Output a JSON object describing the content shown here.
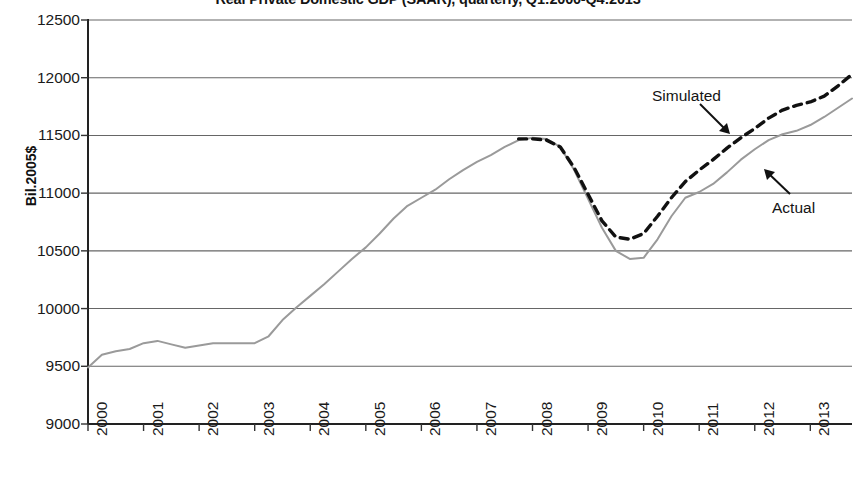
{
  "chart_data": {
    "type": "line",
    "title": "Real Private Domestic GDP (SAAR), quarterly, Q1:2000-Q4:2013",
    "xlabel": "",
    "ylabel": "Bil.2005$",
    "ylim": [
      9000,
      12500
    ],
    "ytick_step": 500,
    "yticks": [
      "12500",
      "12000",
      "11500",
      "11000",
      "10500",
      "10000",
      "9500",
      "9000"
    ],
    "xlim": [
      2000,
      2013.75
    ],
    "xticks": [
      "2000",
      "2001",
      "2002",
      "2003",
      "2004",
      "2005",
      "2006",
      "2007",
      "2008",
      "2009",
      "2010",
      "2011",
      "2012",
      "2013"
    ],
    "grid": "horizontal",
    "legend_position": "inline-annotations",
    "annotations": [
      {
        "label": "Simulated",
        "series": "Simulated"
      },
      {
        "label": "Actual",
        "series": "Actual"
      }
    ],
    "series": [
      {
        "name": "Actual",
        "style": "solid",
        "color": "#9a9a9a",
        "x": [
          2000.0,
          2000.25,
          2000.5,
          2000.75,
          2001.0,
          2001.25,
          2001.5,
          2001.75,
          2002.0,
          2002.25,
          2002.5,
          2002.75,
          2003.0,
          2003.25,
          2003.5,
          2003.75,
          2004.0,
          2004.25,
          2004.5,
          2004.75,
          2005.0,
          2005.25,
          2005.5,
          2005.75,
          2006.0,
          2006.25,
          2006.5,
          2006.75,
          2007.0,
          2007.25,
          2007.5,
          2007.75,
          2008.0,
          2008.25,
          2008.5,
          2008.75,
          2009.0,
          2009.25,
          2009.5,
          2009.75,
          2010.0,
          2010.25,
          2010.5,
          2010.75,
          2011.0,
          2011.25,
          2011.5,
          2011.75,
          2012.0,
          2012.25,
          2012.5,
          2012.75,
          2013.0,
          2013.25,
          2013.5,
          2013.75
        ],
        "y": [
          9490,
          9600,
          9630,
          9650,
          9700,
          9720,
          9690,
          9660,
          9680,
          9700,
          9700,
          9700,
          9700,
          9760,
          9900,
          10010,
          10110,
          10210,
          10320,
          10430,
          10530,
          10650,
          10780,
          10890,
          10960,
          11030,
          11120,
          11200,
          11270,
          11330,
          11400,
          11460,
          11480,
          11470,
          11400,
          11200,
          10950,
          10700,
          10500,
          10430,
          10440,
          10600,
          10800,
          10960,
          11010,
          11080,
          11180,
          11290,
          11380,
          11460,
          11510,
          11540,
          11590,
          11660,
          11740,
          11820
        ]
      },
      {
        "name": "Simulated",
        "style": "dashed",
        "color": "#111111",
        "x": [
          2007.75,
          2008.0,
          2008.25,
          2008.5,
          2008.75,
          2009.0,
          2009.25,
          2009.5,
          2009.75,
          2010.0,
          2010.25,
          2010.5,
          2010.75,
          2011.0,
          2011.25,
          2011.5,
          2011.75,
          2012.0,
          2012.25,
          2012.5,
          2012.75,
          2013.0,
          2013.25,
          2013.5,
          2013.75
        ],
        "y": [
          11470,
          11470,
          11460,
          11400,
          11220,
          10990,
          10760,
          10620,
          10600,
          10650,
          10800,
          10960,
          11100,
          11200,
          11290,
          11390,
          11480,
          11560,
          11650,
          11720,
          11760,
          11790,
          11840,
          11930,
          12030
        ]
      }
    ]
  }
}
